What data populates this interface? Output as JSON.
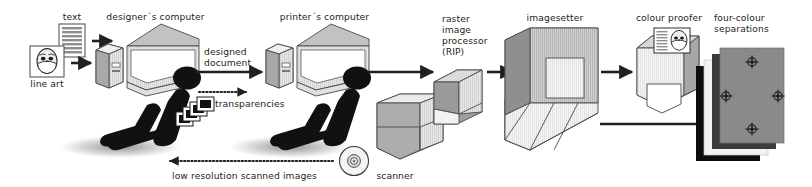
{
  "diagram": {
    "background": "#ffffff",
    "text_color": "#231f20",
    "nodes": [
      {
        "id": "text",
        "label": "text",
        "x": 68,
        "y": 11,
        "kind": "document-thumbnail"
      },
      {
        "id": "line-art",
        "label": "line art",
        "x": 47,
        "y": 77,
        "kind": "lineart-thumbnail"
      },
      {
        "id": "designers-computer",
        "label": "designer´s computer",
        "x": 155,
        "y": 12,
        "kind": "computer"
      },
      {
        "id": "designer-person",
        "label": "",
        "x": 120,
        "y": 95,
        "kind": "person-silhouette"
      },
      {
        "id": "transparencies",
        "label": "transparencies",
        "x": 248,
        "y": 100,
        "kind": "slide-stack"
      },
      {
        "id": "printers-computer",
        "label": "printer´s computer",
        "x": 320,
        "y": 12,
        "kind": "computer"
      },
      {
        "id": "printer-person",
        "label": "",
        "x": 290,
        "y": 95,
        "kind": "person-silhouette"
      },
      {
        "id": "scanner",
        "label": "scanner",
        "x": 390,
        "y": 168,
        "kind": "box3d"
      },
      {
        "id": "cd",
        "label": "",
        "x": 354,
        "y": 160,
        "kind": "disc"
      },
      {
        "id": "rip",
        "label": "raster\nimage\nprocessor\n(RIP)",
        "x": 445,
        "y": 14,
        "kind": "slab3d"
      },
      {
        "id": "imagesetter",
        "label": "imagesetter",
        "x": 558,
        "y": 12,
        "kind": "imagesetter3d"
      },
      {
        "id": "colour-proofer",
        "label": "colour proofer",
        "x": 659,
        "y": 12,
        "kind": "printer3d"
      },
      {
        "id": "separations",
        "label": "four-colour\nseparations",
        "x": 748,
        "y": 12,
        "kind": "sheet-stack"
      }
    ],
    "edges": [
      {
        "id": "text-to-tower",
        "label": "",
        "style": "solid",
        "direction": "right"
      },
      {
        "id": "lineart-to-tower",
        "label": "",
        "style": "solid",
        "direction": "right"
      },
      {
        "id": "designed-document",
        "label": "designed\ndocument",
        "style": "solid",
        "direction": "right"
      },
      {
        "id": "transparencies-flow",
        "label": "transparencies",
        "style": "dotted",
        "direction": "right"
      },
      {
        "id": "low-res-return",
        "label": "low resolution scanned images",
        "style": "dotted",
        "direction": "left"
      },
      {
        "id": "printer-to-rip",
        "label": "",
        "style": "solid",
        "direction": "right"
      },
      {
        "id": "rip-to-imagesetter",
        "label": "",
        "style": "solid",
        "direction": "right"
      },
      {
        "id": "imagesetter-to-proofer",
        "label": "",
        "style": "solid",
        "direction": "right"
      },
      {
        "id": "proofer-to-seps",
        "label": "",
        "style": "solid",
        "direction": "right"
      },
      {
        "id": "imagesetter-to-seps",
        "label": "",
        "style": "solid",
        "direction": "right"
      }
    ],
    "labels": {
      "text": "text",
      "line_art": "line art",
      "designers_computer": "designer´s computer",
      "printers_computer": "printer´s computer",
      "designed_document_1": "designed",
      "designed_document_2": "document",
      "transparencies": "transparencies",
      "low_resolution": "low resolution scanned images",
      "scanner": "scanner",
      "rip_1": "raster",
      "rip_2": "image",
      "rip_3": "processor",
      "rip_4": "(RIP)",
      "imagesetter": "imagesetter",
      "colour_proofer": "colour proofer",
      "separations_1": "four-colour",
      "separations_2": "separations"
    },
    "colors": {
      "ink": "#231f20",
      "outline": "#3a3a3a",
      "face_light": "#e3e3e3",
      "face_mid": "#c9c9c9",
      "face_dark": "#8f8f8f",
      "face_darker": "#6e6e6e",
      "sep_black": "#0d0d0d",
      "sep_white": "#f2f2f2",
      "sep_dark": "#3c3c3c",
      "sep_gray": "#8a8a8a"
    }
  }
}
